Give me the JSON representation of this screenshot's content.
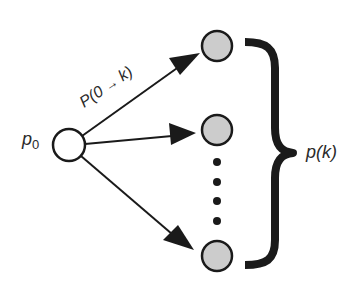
{
  "diagram": {
    "type": "branching-probability",
    "colors": {
      "background": "#ffffff",
      "stroke": "#1a1a1a",
      "source_fill": "#ffffff",
      "target_fill": "#cccccc",
      "text": "#2a2a2a"
    },
    "source_node": {
      "label_main": "p",
      "label_sub": "0",
      "cx": 69,
      "cy": 145,
      "r": 16
    },
    "target_nodes": [
      {
        "id": "top",
        "cx": 217,
        "cy": 46,
        "r": 15
      },
      {
        "id": "middle",
        "cx": 217,
        "cy": 130,
        "r": 15
      },
      {
        "id": "bottom",
        "cx": 217,
        "cy": 256,
        "r": 15
      }
    ],
    "ellipsis_dots": [
      {
        "cx": 217,
        "cy": 162
      },
      {
        "cx": 217,
        "cy": 182
      },
      {
        "cx": 217,
        "cy": 201
      },
      {
        "cx": 217,
        "cy": 221
      }
    ],
    "edges": [
      {
        "from": "source",
        "to": "top",
        "label": "P(0 → k)"
      },
      {
        "from": "source",
        "to": "middle",
        "label": ""
      },
      {
        "from": "source",
        "to": "bottom",
        "label": ""
      }
    ],
    "edge_label": {
      "prefix": "P(0 ",
      "arrow": "→",
      "suffix": " k)"
    },
    "brace_label": {
      "main": "p(",
      "var": "k",
      "close": ")"
    }
  }
}
